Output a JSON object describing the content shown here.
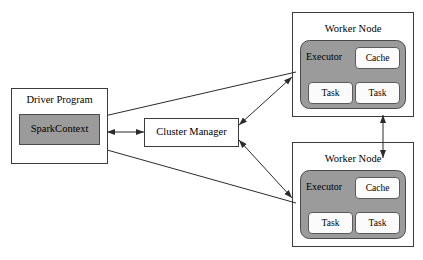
{
  "diagram": {
    "colors": {
      "background": "#ffffff",
      "fill_gray": "#9b9b9b",
      "chip_fill": "#fbfbfb",
      "stroke": "#3c3c3c",
      "arrow": "#2b2b2b",
      "text": "#000000"
    },
    "driver": {
      "label": "Driver Program",
      "context_label": "SparkContext"
    },
    "cluster_manager": {
      "label": "Cluster Manager"
    },
    "workers": [
      {
        "title": "Worker Node",
        "executor_label": "Executor",
        "cache_label": "Cache",
        "tasks": [
          {
            "label": "Task"
          },
          {
            "label": "Task"
          }
        ]
      },
      {
        "title": "Worker Node",
        "executor_label": "Executor",
        "cache_label": "Cache",
        "tasks": [
          {
            "label": "Task"
          },
          {
            "label": "Task"
          }
        ]
      }
    ],
    "connections": [
      {
        "name": "driver-cluster-manager",
        "kind": "double-arrow"
      },
      {
        "name": "cluster-manager-worker-top",
        "kind": "double-arrow"
      },
      {
        "name": "cluster-manager-worker-bottom",
        "kind": "double-arrow"
      },
      {
        "name": "worker-top-sparkcontext",
        "kind": "arrow"
      },
      {
        "name": "worker-bottom-sparkcontext",
        "kind": "arrow"
      },
      {
        "name": "worker-top-worker-bottom",
        "kind": "double-arrow"
      }
    ]
  }
}
